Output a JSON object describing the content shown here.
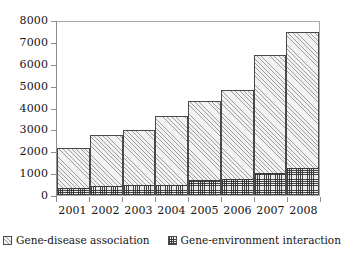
{
  "chart_data": {
    "type": "bar",
    "subtype": "stacked-bar",
    "title": "",
    "subtitle": "",
    "xlabel": "",
    "ylabel": "",
    "categories": [
      "2001",
      "2002",
      "2003",
      "2004",
      "2005",
      "2006",
      "2007",
      "2008"
    ],
    "series": [
      {
        "name": "Gene-disease association",
        "pattern": "diagonal-hatch-light",
        "values": [
          1800,
          2330,
          2500,
          3140,
          3640,
          4060,
          5430,
          6200
        ]
      },
      {
        "name": "Gene-environment interaction",
        "pattern": "cross-hatch-dark",
        "values": [
          330,
          430,
          450,
          480,
          680,
          720,
          990,
          1230
        ]
      }
    ],
    "totals": [
      2130,
      2760,
      2950,
      3620,
      4320,
      4780,
      6420,
      7430
    ],
    "ylim": [
      0,
      8000
    ],
    "yticks": [
      0,
      1000,
      2000,
      3000,
      4000,
      5000,
      6000,
      7000,
      8000
    ],
    "ytick_labels": [
      "0",
      "1000",
      "2000",
      "3000",
      "4000",
      "5000",
      "6000",
      "7000",
      "8000"
    ],
    "grid": false,
    "legend_position": "bottom-center",
    "legend": [
      {
        "label": "Gene-disease association",
        "swatch": "diagonal-hatch-swatch"
      },
      {
        "label": "Gene-environment interaction",
        "swatch": "cross-hatch-swatch"
      }
    ],
    "colors": {
      "light_fill": "#f2f2f2",
      "dark_fill": "#eaeaea",
      "hatch": "#5a5a5a",
      "bar_outline": "#4a4a4a",
      "axis": "#8d8d8d",
      "frame": "#a8a8a8",
      "text": "#141414",
      "background": "#ffffff"
    }
  }
}
